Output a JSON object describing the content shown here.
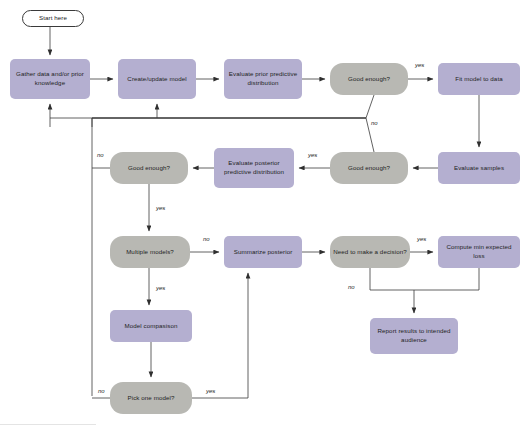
{
  "diagram": {
    "colors": {
      "process_fill": "#b4afd0",
      "decision_fill": "#b8b8b3",
      "terminal_fill": "#ffffff",
      "edge_stroke": "#3a3a3a",
      "text": "#232323",
      "background": "#ffffff"
    },
    "nodes": [
      {
        "id": "start",
        "label": "Start here",
        "type": "terminal",
        "x": 22,
        "y": 10,
        "w": 62,
        "h": 17
      },
      {
        "id": "gather",
        "label": "Gather data and/or prior knowledge",
        "type": "process",
        "x": 10,
        "y": 59,
        "w": 80,
        "h": 40
      },
      {
        "id": "create",
        "label": "Create/update model",
        "type": "process",
        "x": 118,
        "y": 59,
        "w": 78,
        "h": 40
      },
      {
        "id": "evalprior",
        "label": "Evaluate prior predictive distribution",
        "type": "process",
        "x": 224,
        "y": 59,
        "w": 78,
        "h": 40
      },
      {
        "id": "good1",
        "label": "Good enough?",
        "type": "decision",
        "x": 330,
        "y": 63,
        "w": 78,
        "h": 32
      },
      {
        "id": "fit",
        "label": "Fit model to data",
        "type": "process",
        "x": 438,
        "y": 63,
        "w": 82,
        "h": 32
      },
      {
        "id": "evalsamples",
        "label": "Evaluate samples",
        "type": "process",
        "x": 438,
        "y": 152,
        "w": 82,
        "h": 32
      },
      {
        "id": "good2",
        "label": "Good enough?",
        "type": "decision",
        "x": 330,
        "y": 152,
        "w": 78,
        "h": 32
      },
      {
        "id": "evalpost",
        "label": "Evaluate posterior predictive distribution",
        "type": "process",
        "x": 214,
        "y": 148,
        "w": 80,
        "h": 40
      },
      {
        "id": "good3",
        "label": "Good enough?",
        "type": "decision",
        "x": 110,
        "y": 152,
        "w": 78,
        "h": 32
      },
      {
        "id": "multiple",
        "label": "Multiple models?",
        "type": "decision",
        "x": 110,
        "y": 236,
        "w": 80,
        "h": 32
      },
      {
        "id": "summarize",
        "label": "Summarize posterior",
        "type": "process",
        "x": 224,
        "y": 236,
        "w": 78,
        "h": 32
      },
      {
        "id": "needdecision",
        "label": "Need to make a decision?",
        "type": "decision",
        "x": 330,
        "y": 236,
        "w": 80,
        "h": 32
      },
      {
        "id": "computeloss",
        "label": "Compute min expected loss",
        "type": "process",
        "x": 438,
        "y": 236,
        "w": 82,
        "h": 32
      },
      {
        "id": "modelcomp",
        "label": "Model compasison",
        "type": "process",
        "x": 110,
        "y": 310,
        "w": 82,
        "h": 32
      },
      {
        "id": "pickone",
        "label": "Pick one model?",
        "type": "decision",
        "x": 110,
        "y": 382,
        "w": 82,
        "h": 32
      },
      {
        "id": "report",
        "label": "Report results to intended audience",
        "type": "process",
        "x": 370,
        "y": 318,
        "w": 88,
        "h": 36
      }
    ],
    "edge_labels": [
      {
        "id": "good1-yes",
        "text": "yes",
        "x": 415,
        "y": 62
      },
      {
        "id": "good1-no",
        "text": "no",
        "x": 371,
        "y": 120
      },
      {
        "id": "good2-yes",
        "text": "yes",
        "x": 308,
        "y": 152
      },
      {
        "id": "good3-no",
        "text": "no",
        "x": 97,
        "y": 152
      },
      {
        "id": "good3-yes",
        "text": "yes",
        "x": 156,
        "y": 205
      },
      {
        "id": "multiple-no",
        "text": "no",
        "x": 203,
        "y": 236
      },
      {
        "id": "multiple-yes",
        "text": "yes",
        "x": 156,
        "y": 285
      },
      {
        "id": "need-yes",
        "text": "yes",
        "x": 417,
        "y": 236
      },
      {
        "id": "need-no",
        "text": "no",
        "x": 348,
        "y": 284
      },
      {
        "id": "pick-no",
        "text": "no",
        "x": 98,
        "y": 388
      },
      {
        "id": "pick-yes",
        "text": "yes",
        "x": 206,
        "y": 388
      }
    ]
  }
}
